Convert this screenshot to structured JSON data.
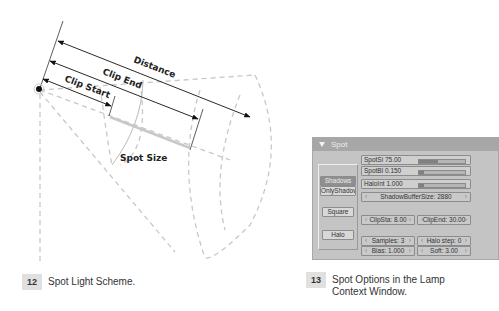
{
  "figure12": {
    "labels": {
      "distance": "Distance",
      "clip_end": "Clip End",
      "clip_start": "Clip Start",
      "spot_size": "Spot Size"
    },
    "caption": {
      "number": "12",
      "text": "Spot Light Scheme."
    }
  },
  "figure13": {
    "panel": {
      "title": "Spot",
      "toggles": [
        {
          "label": "Shadows",
          "active": true
        },
        {
          "label": "OnlyShadow",
          "active": false
        },
        {
          "label": "Square",
          "active": false
        },
        {
          "label": "Halo",
          "active": false
        }
      ],
      "sliders": [
        {
          "label": "SpotSi 75.00",
          "fill_pct": 42
        },
        {
          "label": "SpotBl 0.150",
          "fill_pct": 10
        },
        {
          "label": "HaloInt 1.000",
          "fill_pct": 10
        }
      ],
      "shadow_buffer": "ShadowBufferSize: 2880",
      "clip_sta": "ClipSta: 8.00",
      "clip_end": "ClipEnd: 30.00",
      "samples": "Samples: 3",
      "halo_step": "Halo step: 0",
      "bias": "Bias: 1.000",
      "soft": "Soft: 3.00"
    },
    "caption": {
      "number": "13",
      "text_line1": "Spot Options in the Lamp",
      "text_line2": "Context Window."
    }
  },
  "colors": {
    "panel_bg": "#c4c4c4",
    "panel_header": "#a7a7a7",
    "active_toggle": "#8f8f8f",
    "dashed": "#c8c8c8"
  }
}
